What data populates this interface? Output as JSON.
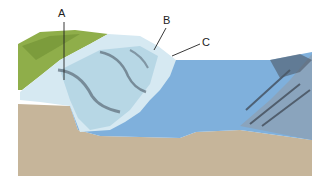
{
  "diagram": {
    "type": "glacier terminus / ice shelf cross-section illustration",
    "labels": [
      {
        "id": "A",
        "text": "A",
        "x": 61,
        "y": 10,
        "points_to": "vertical line through glacier ice near land"
      },
      {
        "id": "B",
        "text": "B",
        "x": 166,
        "y": 18,
        "points_to": "glacier front / crevassed face"
      },
      {
        "id": "C",
        "text": "C",
        "x": 203,
        "y": 40,
        "points_to": "waterline at glacier terminus"
      }
    ],
    "colors": {
      "ground": "#c6b59a",
      "water": "#7fb0dc",
      "ice_light": "#d6e9f2",
      "ice_mid": "#a9cfe0",
      "vegetation": "#8fae4a",
      "rock": "#4d5866",
      "label_line": "#222222"
    }
  }
}
